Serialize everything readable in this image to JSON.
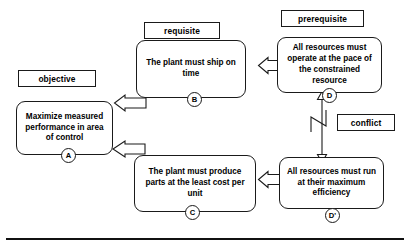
{
  "diagram": {
    "accent_color": "#000000",
    "background_color": "#ffffff"
  },
  "tags": [
    {
      "id": "objective",
      "label": "objective"
    },
    {
      "id": "requisite",
      "label": "requisite"
    },
    {
      "id": "prerequisite",
      "label": "prerequisite"
    },
    {
      "id": "conflict",
      "label": "conflict"
    }
  ],
  "boxes": [
    {
      "id": "A",
      "marker": "A",
      "text": "Maximize measured performance in area of control"
    },
    {
      "id": "B",
      "marker": "B",
      "text": "The plant must ship on time"
    },
    {
      "id": "C",
      "marker": "C",
      "text": "The plant must produce parts at the least cost per unit"
    },
    {
      "id": "D",
      "marker": "D",
      "text": "All resources must operate at the pace of the constrained resource"
    },
    {
      "id": "Dprime",
      "marker": "D'",
      "text": "All resources must run at their maximum efficiency"
    }
  ],
  "connectors": [
    {
      "id": "b-to-a",
      "from": "B",
      "to": "A",
      "style": "hollow-block-arrow",
      "direction": "left"
    },
    {
      "id": "c-to-a",
      "from": "C",
      "to": "A",
      "style": "hollow-block-arrow",
      "direction": "left"
    },
    {
      "id": "d-to-b",
      "from": "D",
      "to": "B",
      "style": "hollow-block-arrow",
      "direction": "left"
    },
    {
      "id": "dp-to-c",
      "from": "D'",
      "to": "C",
      "style": "hollow-block-arrow",
      "direction": "left"
    },
    {
      "id": "d-conflict-dp",
      "from": "D",
      "to": "D'",
      "style": "double-headed-zigzag",
      "direction": "vertical"
    }
  ]
}
